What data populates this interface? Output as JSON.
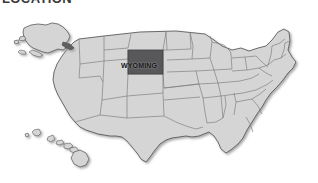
{
  "header": {
    "title": "LOCATION"
  },
  "map": {
    "name": "united-states-map",
    "background_color": "#ffffff",
    "state_fill_color": "#d5d5d5",
    "state_border_color": "#6e6e6e",
    "highlight_color": "#58585a",
    "shadow_color": "#b3b3b3",
    "highlighted_state": "WYOMING",
    "label_color": "#121212",
    "insets": [
      {
        "name": "alaska",
        "label": "Alaska"
      },
      {
        "name": "hawaii",
        "label": "Hawaii"
      }
    ],
    "highlight_box": {
      "x": 128,
      "y": 40,
      "width": 35,
      "height": 24
    },
    "label_position": {
      "x": 121,
      "y": 52
    }
  }
}
